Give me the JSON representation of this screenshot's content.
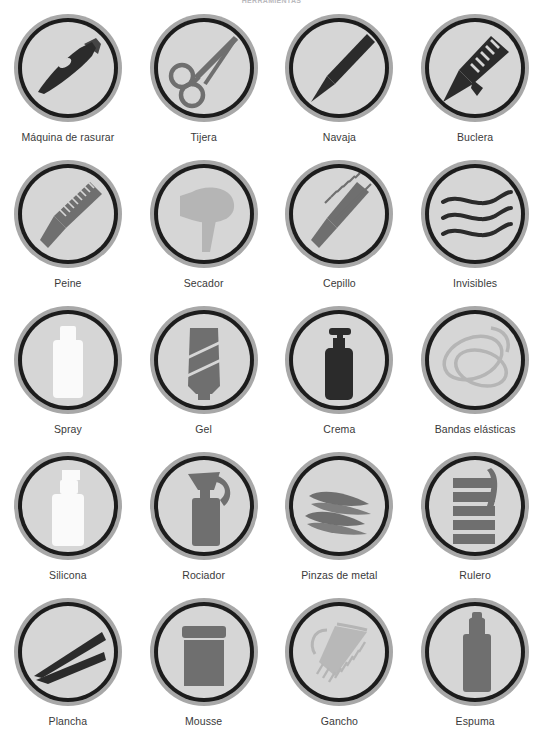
{
  "header": {
    "title": "HERRAMIENTAS"
  },
  "grid": {
    "columns": 4,
    "rows": 5,
    "badge_colors": {
      "outer_ring": "#a8a8a8",
      "inner_ring": "#1c1c1c",
      "disc_fill": "#d6d6d6",
      "icon_dark": "#2b2b2b",
      "icon_mid": "#6f6f6f",
      "icon_light": "#b5b5b5",
      "icon_white": "#fafafa",
      "caption_text": "#3a3a3a"
    },
    "items": [
      {
        "id": "maquina-de-rasurar",
        "label": "Máquina de rasurar",
        "icon": "clipper-icon",
        "tone": "dark"
      },
      {
        "id": "tijera",
        "label": "Tijera",
        "icon": "scissors-icon",
        "tone": "mid"
      },
      {
        "id": "navaja",
        "label": "Navaja",
        "icon": "razor-icon",
        "tone": "dark"
      },
      {
        "id": "buclera",
        "label": "Buclera",
        "icon": "curling-iron-icon",
        "tone": "dark"
      },
      {
        "id": "peine",
        "label": "Peine",
        "icon": "comb-icon",
        "tone": "mid"
      },
      {
        "id": "secador",
        "label": "Secador",
        "icon": "hair-dryer-icon",
        "tone": "light"
      },
      {
        "id": "cepillo",
        "label": "Cepillo",
        "icon": "round-brush-icon",
        "tone": "mid"
      },
      {
        "id": "invisibles",
        "label": "Invisibles",
        "icon": "bobby-pins-icon",
        "tone": "dark"
      },
      {
        "id": "spray",
        "label": "Spray",
        "icon": "spray-bottle-icon",
        "tone": "white"
      },
      {
        "id": "gel",
        "label": "Gel",
        "icon": "gel-tube-icon",
        "tone": "mid"
      },
      {
        "id": "crema",
        "label": "Crema",
        "icon": "pump-bottle-icon",
        "tone": "dark"
      },
      {
        "id": "bandas-elasticas",
        "label": "Bandas elásticas",
        "icon": "elastic-bands-icon",
        "tone": "light"
      },
      {
        "id": "silicona",
        "label": "Silicona",
        "icon": "silicone-bottle-icon",
        "tone": "white"
      },
      {
        "id": "rociador",
        "label": "Rociador",
        "icon": "trigger-sprayer-icon",
        "tone": "mid"
      },
      {
        "id": "pinzas-de-metal",
        "label": "Pinzas de metal",
        "icon": "metal-clips-icon",
        "tone": "mid"
      },
      {
        "id": "rulero",
        "label": "Rulero",
        "icon": "hair-roller-icon",
        "tone": "mid"
      },
      {
        "id": "plancha",
        "label": "Plancha",
        "icon": "flat-iron-icon",
        "tone": "dark"
      },
      {
        "id": "mousse",
        "label": "Mousse",
        "icon": "mousse-jar-icon",
        "tone": "mid"
      },
      {
        "id": "gancho",
        "label": "Gancho",
        "icon": "hair-clip-icon",
        "tone": "light"
      },
      {
        "id": "espuma",
        "label": "Espuma",
        "icon": "aerosol-can-icon",
        "tone": "mid"
      }
    ]
  }
}
